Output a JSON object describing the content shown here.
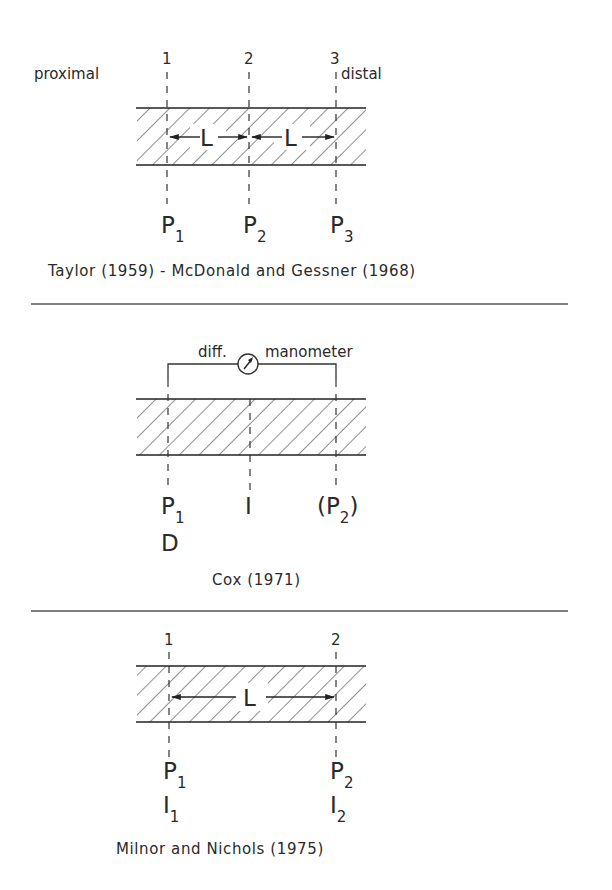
{
  "colors": {
    "ink": "#2a2a2a",
    "background": "#ffffff",
    "separator": "#555555"
  },
  "panels": [
    {
      "id": "taylor",
      "station_numbers": [
        "1",
        "2",
        "3"
      ],
      "side_labels": {
        "left": "proximal",
        "right": "distal"
      },
      "spacing_labels": [
        "L",
        "L"
      ],
      "pressure_labels": [
        {
          "main": "P",
          "sub": "1"
        },
        {
          "main": "P",
          "sub": "2"
        },
        {
          "main": "P",
          "sub": "3"
        }
      ],
      "caption": "Taylor (1959) - McDonald and Gessner (1968)"
    },
    {
      "id": "cox",
      "manometer_label_left": "diff.",
      "manometer_label_right": "manometer",
      "gauge_icon": "pressure-gauge-icon",
      "point_labels": [
        {
          "main": "P",
          "sub": "1",
          "below": "D"
        },
        {
          "main": "I",
          "sub": ""
        },
        {
          "main": "(P",
          "sub": "2",
          "close": ")"
        }
      ],
      "caption": "Cox (1971)"
    },
    {
      "id": "milnor",
      "station_numbers": [
        "1",
        "2"
      ],
      "spacing_label": "L",
      "point_labels": [
        {
          "p_main": "P",
          "p_sub": "1",
          "i_main": "I",
          "i_sub": "1"
        },
        {
          "p_main": "P",
          "p_sub": "2",
          "i_main": "I",
          "i_sub": "2"
        }
      ],
      "caption": "Milnor and Nichols (1975)"
    }
  ]
}
